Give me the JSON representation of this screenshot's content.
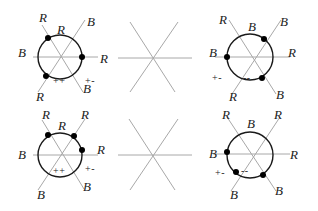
{
  "figure": {
    "panels": [
      {
        "id": "top-left",
        "labels": [
          "R",
          "R",
          "B",
          "B",
          "R",
          "B",
          "R"
        ],
        "signs": [
          "++",
          "+-"
        ]
      },
      {
        "id": "top-middle",
        "labels": [],
        "signs": []
      },
      {
        "id": "top-right",
        "labels": [
          "R",
          "B",
          "B",
          "B",
          "R",
          "R",
          "B"
        ],
        "signs": [
          "+-",
          "--"
        ]
      },
      {
        "id": "bottom-left",
        "labels": [
          "R",
          "R",
          "R",
          "B",
          "R",
          "B",
          "B"
        ],
        "signs": [
          "++",
          "+-"
        ]
      },
      {
        "id": "bottom-middle",
        "labels": [],
        "signs": []
      },
      {
        "id": "bottom-right",
        "labels": [
          "R",
          "B",
          "R",
          "B",
          "R",
          "B",
          "B"
        ],
        "signs": [
          "+-",
          "--"
        ]
      }
    ]
  }
}
